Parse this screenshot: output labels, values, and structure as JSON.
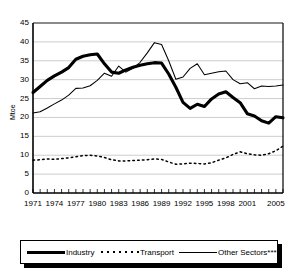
{
  "chart_data": {
    "type": "line",
    "title": "",
    "subtitle": "",
    "xlabel": "",
    "ylabel": "Mtoe",
    "ylim": [
      0,
      45
    ],
    "ytick_values": [
      0,
      5,
      10,
      15,
      20,
      25,
      30,
      35,
      40,
      45
    ],
    "ytick_labels": [
      "0",
      "5",
      "10",
      "15",
      "20",
      "25",
      "30",
      "35",
      "40",
      "45"
    ],
    "xlim": [
      1971,
      2006
    ],
    "xtick_labels": [
      "1971",
      "1974",
      "1977",
      "1980",
      "1983",
      "1986",
      "1989",
      "1992",
      "1995",
      "1998",
      "2001",
      "2005"
    ],
    "xtick_values": [
      1971,
      1974,
      1977,
      1980,
      1983,
      1986,
      1989,
      1992,
      1995,
      1998,
      2001,
      2005
    ],
    "grid": "horizontal",
    "legend_position": "bottom",
    "x": [
      1971,
      1972,
      1973,
      1974,
      1975,
      1976,
      1977,
      1978,
      1979,
      1980,
      1981,
      1982,
      1983,
      1984,
      1985,
      1986,
      1987,
      1988,
      1989,
      1990,
      1991,
      1992,
      1993,
      1994,
      1995,
      1996,
      1997,
      1998,
      1999,
      2000,
      2001,
      2002,
      2003,
      2004,
      2005,
      2006
    ],
    "series": [
      {
        "name": "Industry",
        "style": "thick-solid",
        "color": "#000000",
        "values": [
          26.6,
          28.2,
          29.8,
          31.0,
          32.0,
          33.2,
          35.4,
          36.2,
          36.6,
          36.8,
          34.2,
          32.0,
          31.7,
          32.6,
          33.3,
          33.8,
          34.2,
          34.5,
          34.4,
          31.5,
          28.0,
          24.0,
          22.4,
          23.5,
          22.9,
          24.9,
          26.2,
          26.8,
          25.3,
          23.9,
          21.0,
          20.4,
          19.1,
          18.5,
          20.2,
          19.9
        ]
      },
      {
        "name": "Transport",
        "style": "dotted",
        "color": "#000000",
        "values": [
          8.7,
          8.8,
          9.0,
          8.9,
          9.1,
          9.3,
          9.6,
          9.9,
          10.0,
          9.8,
          9.4,
          8.8,
          8.5,
          8.5,
          8.6,
          8.7,
          8.8,
          9.0,
          8.9,
          8.2,
          7.6,
          7.7,
          7.9,
          7.8,
          7.7,
          8.0,
          8.7,
          9.3,
          10.2,
          10.9,
          10.4,
          10.1,
          10.0,
          10.4,
          11.2,
          12.4
        ]
      },
      {
        "name": "Other Sectors****",
        "style": "thin-solid",
        "color": "#000000",
        "values": [
          21.2,
          21.5,
          22.5,
          23.6,
          24.6,
          25.9,
          27.7,
          27.8,
          28.4,
          29.8,
          31.7,
          30.9,
          33.6,
          32.0,
          33.0,
          34.6,
          37.1,
          39.8,
          39.3,
          35.0,
          30.1,
          30.7,
          33.0,
          34.2,
          31.3,
          31.7,
          32.1,
          32.3,
          30.0,
          28.9,
          29.2,
          27.6,
          28.3,
          28.2,
          28.3,
          28.6
        ]
      }
    ]
  },
  "yaxis": {
    "label": "Mtoe",
    "ticks": [
      "45",
      "40",
      "35",
      "30",
      "25",
      "20",
      "15",
      "10",
      "5",
      "0"
    ]
  },
  "xaxis": {
    "ticks": [
      "1971",
      "1974",
      "1977",
      "1980",
      "1983",
      "1986",
      "1989",
      "1992",
      "1995",
      "1998",
      "2001",
      "2005"
    ]
  },
  "legend": {
    "items": [
      {
        "label": "Industry",
        "style": "thick-solid"
      },
      {
        "label": "Transport",
        "style": "dotted"
      },
      {
        "label": "Other Sectors****",
        "style": "thin-solid"
      }
    ]
  }
}
